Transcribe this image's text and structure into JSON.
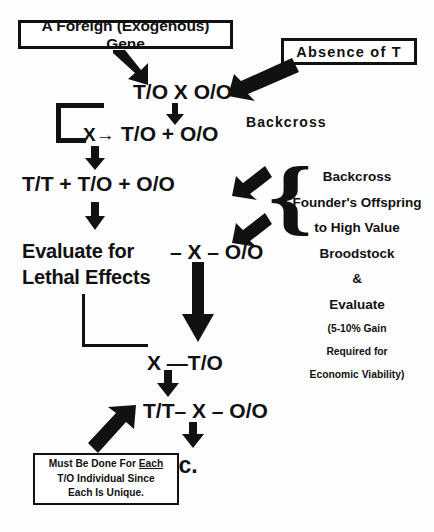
{
  "diagram": {
    "boxes": {
      "foreign_gene": "A Foreign (Exogenous) Gene",
      "absence_of_t": "Absence of T",
      "note_line1_a": "Must Be Done For ",
      "note_line1_b": "Each",
      "note_line2": "T/O Individual Since",
      "note_line3": "Each Is Unique."
    },
    "formulas": {
      "cross1": "T/O  X  O/O",
      "cross2": "T/O  +  O/O",
      "x_arrow": "X→",
      "sum": "T/T  +  T/O  +  O/O",
      "oo": "– X –  O/O",
      "x_to": "X —T/O",
      "tt_x_oo": "T/T– X – O/O",
      "etc": "etc."
    },
    "labels": {
      "evaluate_line1": "Evaluate for",
      "evaluate_line2": "Lethal Effects",
      "backcross_top": "Backcross"
    },
    "right_column": {
      "lines": [
        {
          "text": "Backcross",
          "size": "big"
        },
        {
          "text": "Founder's Offspring",
          "size": "big"
        },
        {
          "text": "to High Value",
          "size": "big"
        },
        {
          "text": "Broodstock",
          "size": "big"
        },
        {
          "text": "&",
          "size": "big"
        },
        {
          "text": "Evaluate",
          "size": "big"
        },
        {
          "text": "(5-10% Gain",
          "size": "small"
        },
        {
          "text": "Required for",
          "size": "small"
        },
        {
          "text": "Economic Viability)",
          "size": "small"
        }
      ]
    },
    "brace_glyph": "{",
    "colors": {
      "ink": "#111111",
      "background": "#ffffff"
    }
  }
}
